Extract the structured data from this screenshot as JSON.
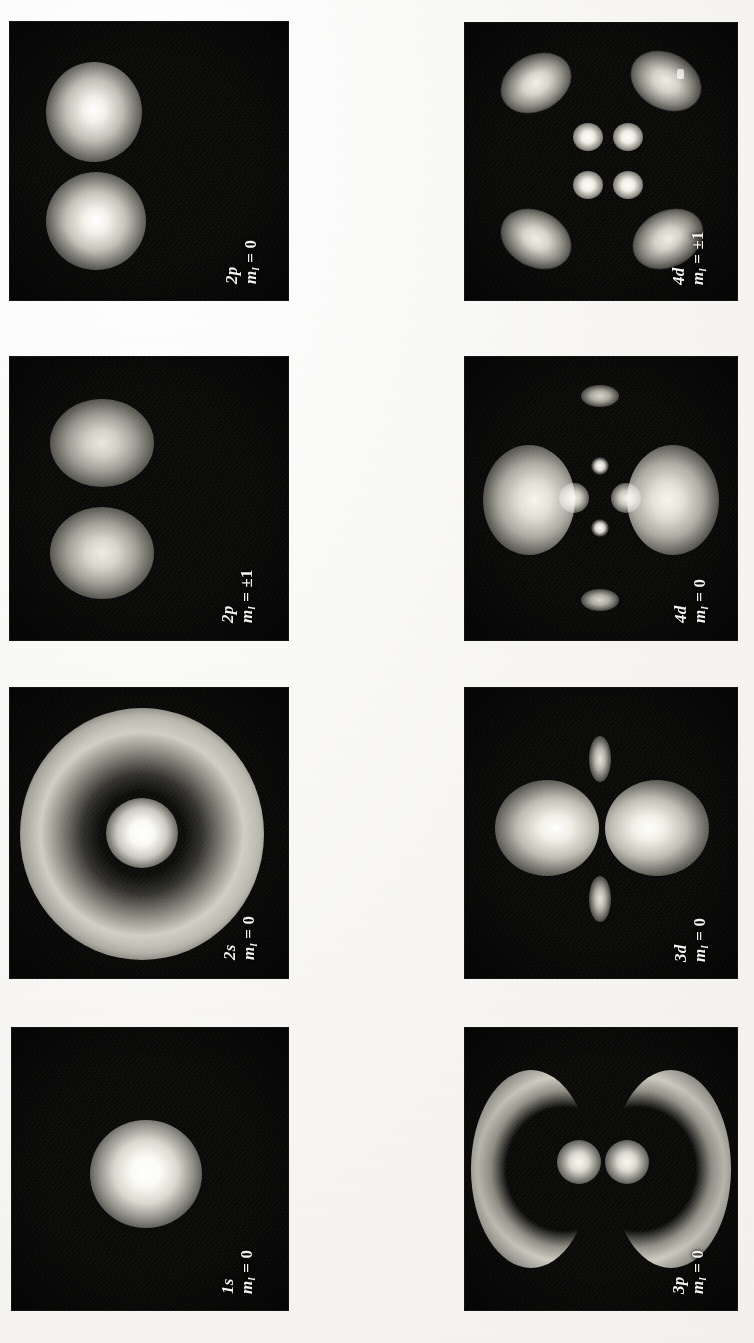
{
  "figure": {
    "kind": "photographic-plates",
    "orientation_deg": -90,
    "background_color": "#f7f6f4",
    "plate_color": "#090908",
    "label_color": "#f4f3ef",
    "columns": 2,
    "rows": 4
  },
  "panels": [
    {
      "id": "2p-m0",
      "orbital": "2p",
      "m_symbol": "m",
      "m_subscript": "l",
      "equals": "=",
      "m_value": "0",
      "label_full": "2p  m_l = 0",
      "column": 0,
      "row": 0,
      "pattern": "two-lobe-vertical"
    },
    {
      "id": "2p-mpm1",
      "orbital": "2p",
      "m_symbol": "m",
      "m_subscript": "l",
      "equals": "=",
      "m_value": "±1",
      "label_full": "2p  m_l = ±1",
      "column": 0,
      "row": 1,
      "pattern": "two-lobe-vertical-soft"
    },
    {
      "id": "2s-m0",
      "orbital": "2s",
      "m_symbol": "m",
      "m_subscript": "l",
      "equals": "=",
      "m_value": "0",
      "label_full": "2s  m_l = 0",
      "column": 0,
      "row": 2,
      "pattern": "core-plus-shell"
    },
    {
      "id": "1s-m0",
      "orbital": "1s",
      "m_symbol": "m",
      "m_subscript": "l",
      "equals": "=",
      "m_value": "0",
      "label_full": "1s  m_l = 0",
      "column": 0,
      "row": 3,
      "pattern": "single-core"
    },
    {
      "id": "4d-mpm1",
      "orbital": "4d",
      "m_symbol": "m",
      "m_subscript": "l",
      "equals": "=",
      "m_value": "±1",
      "label_full": "4d  m_l = ±1",
      "column": 1,
      "row": 0,
      "pattern": "four-outer-four-inner"
    },
    {
      "id": "4d-m0",
      "orbital": "4d",
      "m_symbol": "m",
      "m_subscript": "l",
      "equals": "=",
      "m_value": "0",
      "label_full": "4d  m_l = 0",
      "column": 1,
      "row": 1,
      "pattern": "two-big-lobes-plus-cross"
    },
    {
      "id": "3d-m0",
      "orbital": "3d",
      "m_symbol": "m",
      "m_subscript": "l",
      "equals": "=",
      "m_value": "0",
      "label_full": "3d  m_l = 0",
      "column": 1,
      "row": 2,
      "pattern": "dumbbell-with-small-poles"
    },
    {
      "id": "3p-m0",
      "orbital": "3p",
      "m_symbol": "m",
      "m_subscript": "l",
      "equals": "=",
      "m_value": "0",
      "label_full": "3p  m_l = 0",
      "column": 1,
      "row": 3,
      "pattern": "two-crescents-two-cores"
    }
  ]
}
